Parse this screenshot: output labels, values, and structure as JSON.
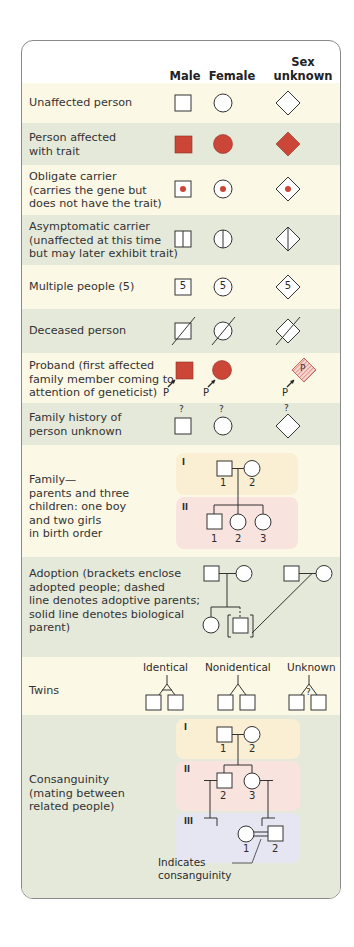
{
  "header": {
    "col_male": "Male",
    "col_female": "Female",
    "col_unknown_line1": "Sex unknown",
    "col_unknown_line2": "or unspecified"
  },
  "colors": {
    "affected": "#cc4637",
    "cream_row": "#fcf8e6",
    "green_row": "#e5e9da",
    "gen1_band": "#fbefd3",
    "gen2_band": "#f9e3df",
    "gen3_band": "#e6e6f3",
    "border": "#8a8a8a"
  },
  "rows": [
    {
      "label": "Unaffected person",
      "symbol": "unaffected"
    },
    {
      "label": "Person affected\nwith trait",
      "symbol": "affected"
    },
    {
      "label": "Obligate carrier\n(carries the gene but\ndoes not have the trait)",
      "symbol": "obligate-carrier"
    },
    {
      "label": "Asymptomatic carrier\n(unaffected at this time\nbut may later exhibit trait)",
      "symbol": "asymptomatic-carrier"
    },
    {
      "label": "Multiple people (5)",
      "symbol": "multiple",
      "count": "5"
    },
    {
      "label": "Deceased person",
      "symbol": "deceased"
    },
    {
      "label": "Proband (first affected\nfamily member coming to\nattention of geneticist)",
      "symbol": "proband",
      "marker": "P"
    },
    {
      "label": "Family history of\nperson unknown",
      "symbol": "unknown-history",
      "marker": "?"
    },
    {
      "label": "Family—\nparents and three\nchildren: one boy\nand two girls\nin birth order",
      "symbol": "family"
    },
    {
      "label": "Adoption (brackets enclose\nadopted people; dashed\nline denotes adoptive parents;\nsolid line denotes biological\nparent)",
      "symbol": "adoption"
    },
    {
      "label": "Twins",
      "symbol": "twins"
    },
    {
      "label": "Consanguinity\n(mating between\nrelated people)",
      "symbol": "consanguinity"
    }
  ],
  "family": {
    "gen_labels": [
      "I",
      "II"
    ],
    "gen1_numbers": [
      "1",
      "2"
    ],
    "gen2_numbers": [
      "1",
      "2",
      "3"
    ]
  },
  "twins": {
    "identical": "Identical",
    "nonidentical": "Nonidentical",
    "unknown": "Unknown",
    "unknown_marker": "?"
  },
  "consanguinity": {
    "gen_labels": [
      "I",
      "II",
      "III"
    ],
    "gen1_numbers": [
      "1",
      "2"
    ],
    "gen2_numbers": [
      "2",
      "3"
    ],
    "gen3_numbers": [
      "1",
      "2"
    ],
    "annotation_line1": "Indicates",
    "annotation_line2": "consanguinity"
  }
}
